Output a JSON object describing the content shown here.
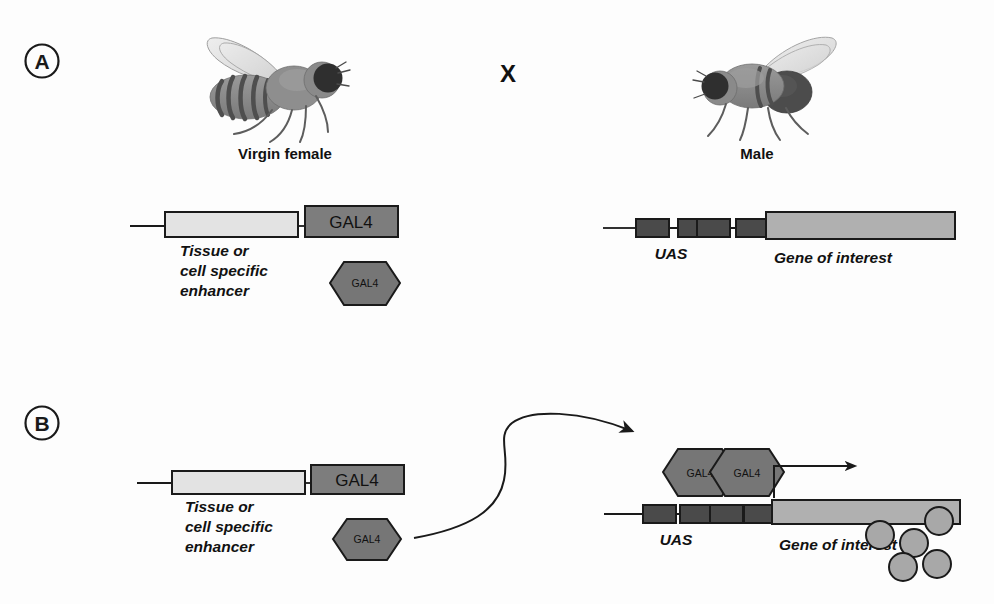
{
  "figure": {
    "width": 994,
    "height": 604,
    "background": "#fdfdfd"
  },
  "colors": {
    "outline": "#1a1a1a",
    "gal4_box_fill": "#7d7d7d",
    "gal4_hex_fill": "#767676",
    "enhancer_fill": "#e3e3e3",
    "uas_box_fill": "#4a4a4a",
    "gene_fill": "#b0b0b0",
    "protein_fill": "#a8a8a8",
    "fly_body": "#8d8d8d",
    "fly_dark": "#3a3a3a",
    "fly_wing": "#dcdcdc",
    "text": "#111111"
  },
  "panels": [
    {
      "id": "A",
      "letter": "A",
      "cross_symbol": "X",
      "parents": [
        {
          "name": "virgin-female",
          "caption": "Virgin female",
          "sex": "female"
        },
        {
          "name": "male",
          "caption": "Male",
          "sex": "male"
        }
      ],
      "driver_construct": {
        "enhancer_label": "Tissue or\ncell specific\nenhancer",
        "enhancer_label_lines": [
          "Tissue or",
          "cell specific",
          "enhancer"
        ],
        "gal4_box_label": "GAL4",
        "gal4_protein_label": "GAL4"
      },
      "responder_construct": {
        "uas_label": "UAS",
        "uas_repeat_count": 4,
        "gene_label": "Gene of interest"
      }
    },
    {
      "id": "B",
      "letter": "B",
      "driver_construct": {
        "enhancer_label_lines": [
          "Tissue or",
          "cell specific",
          "enhancer"
        ],
        "gal4_box_label": "GAL4",
        "gal4_protein_label": "GAL4"
      },
      "responder_construct": {
        "uas_label": "UAS",
        "uas_repeat_count": 4,
        "gene_label": "Gene of interest",
        "bound_gal4_labels": [
          "GAL4",
          "GAL4"
        ],
        "transcription_arrow": true,
        "protein_product_count": 5
      }
    }
  ]
}
